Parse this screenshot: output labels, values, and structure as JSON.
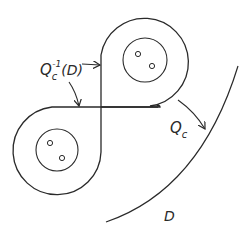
{
  "diagram": {
    "labels": {
      "preimage_main": "Q",
      "preimage_sub": "c",
      "preimage_sup": "-1",
      "preimage_arg": "(D)",
      "map_main": "Q",
      "map_sub": "c",
      "domain": "D"
    },
    "colors": {
      "stroke": "#2a2a2a",
      "background": "#ffffff"
    }
  }
}
